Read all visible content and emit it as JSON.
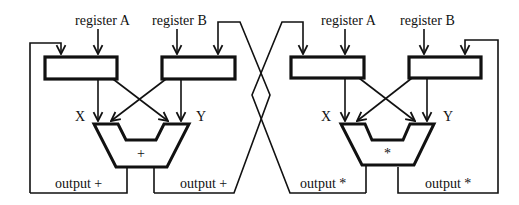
{
  "diagram": {
    "left_unit": {
      "input_a_label": "register A",
      "input_b_label": "register B",
      "operand_x_label": "X",
      "operand_y_label": "Y",
      "operator_symbol": "+",
      "output_left_label": "output +",
      "output_right_label": "output +"
    },
    "right_unit": {
      "input_a_label": "register A",
      "input_b_label": "register B",
      "operand_x_label": "X",
      "operand_y_label": "Y",
      "operator_symbol": "*",
      "output_left_label": "output *",
      "output_right_label": "output *"
    },
    "colors": {
      "stroke": "#111111",
      "background": "#ffffff"
    }
  }
}
